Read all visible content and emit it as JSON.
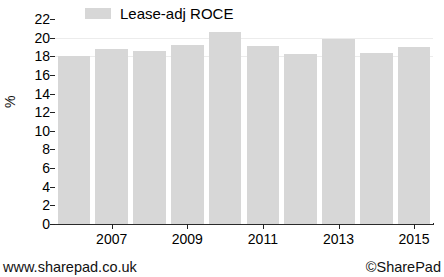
{
  "chart_data": {
    "type": "bar",
    "title": "",
    "subtitle": "",
    "xlabel": "",
    "ylabel": "%",
    "ylim": [
      0,
      22
    ],
    "yticks": [
      0,
      2,
      4,
      6,
      8,
      10,
      12,
      14,
      16,
      18,
      20,
      22
    ],
    "grid": true,
    "legend": {
      "position": "top-left",
      "entries": [
        {
          "name": "Lease-adj ROCE",
          "color": "#d7d7d7"
        }
      ]
    },
    "series": [
      {
        "name": "Lease-adj ROCE",
        "color": "#d7d7d7",
        "values": [
          18.0,
          18.8,
          18.6,
          19.2,
          20.6,
          19.1,
          18.2,
          19.9,
          18.4,
          19.0
        ]
      }
    ],
    "categories": [
      "2006",
      "2007",
      "2008",
      "2009",
      "2010",
      "2011",
      "2012",
      "2013",
      "2014",
      "2015"
    ],
    "xtick_labels": [
      "2007",
      "2009",
      "2011",
      "2013",
      "2015"
    ],
    "xtick_categories": [
      "2007",
      "2009",
      "2011",
      "2013",
      "2015"
    ]
  },
  "footer": {
    "left": "www.sharepad.co.uk",
    "right": "©SharePad"
  }
}
